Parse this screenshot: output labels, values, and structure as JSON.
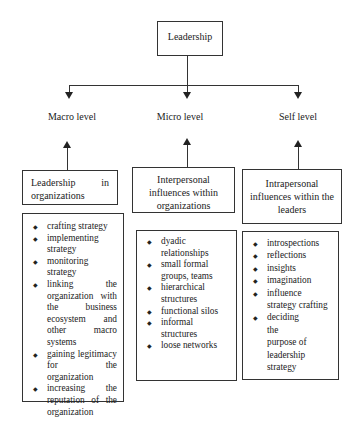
{
  "root": {
    "label": "Leadership"
  },
  "levels": [
    {
      "label": "Macro level"
    },
    {
      "label": "Micro level"
    },
    {
      "label": "Self level"
    }
  ],
  "boxes": [
    {
      "title": "Leadership in organizations",
      "items": [
        "crafting strategy",
        "implementing strategy",
        "monitoring strategy",
        "linking the organization with the business ecosystem and other macro systems",
        "gaining legitimacy for the organization",
        "increasing the reputation of the organization"
      ]
    },
    {
      "title": "Interpersonal influences within organizations",
      "items": [
        "dyadic relationships",
        "small formal groups, teams",
        "hierarchical structures",
        "functional silos",
        "informal structures",
        "loose networks"
      ]
    },
    {
      "title": "Intrapersonal influences within the leaders",
      "items": [
        "introspections",
        "reflections",
        "insights",
        "imagination",
        "influence strategy crafting",
        "deciding the purpose of leadership strategy"
      ]
    }
  ]
}
